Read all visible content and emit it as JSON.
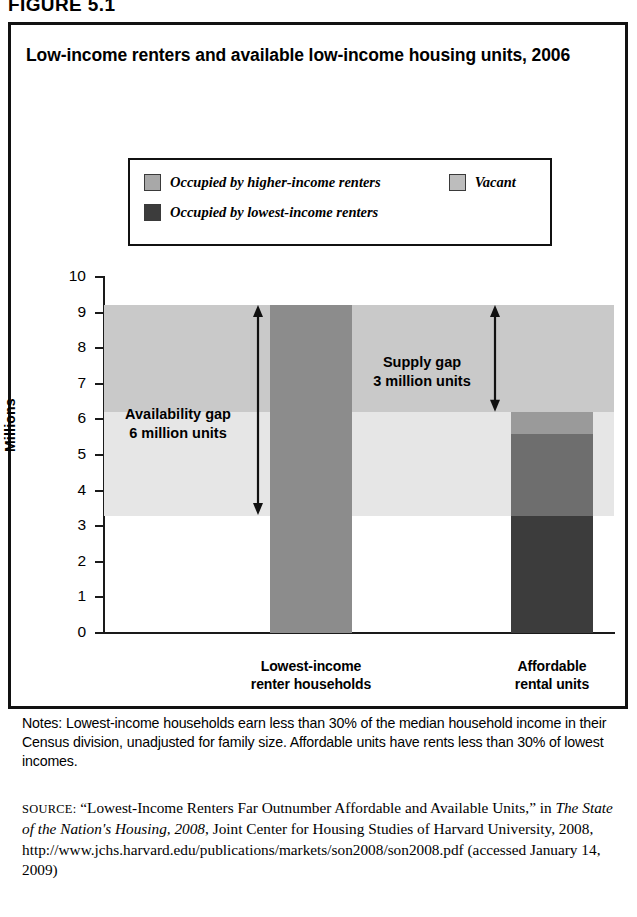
{
  "figure_number": "FIGURE 5.1",
  "title": "Low-income renters and available low-income housing units, 2006",
  "y_axis_title": "Millions",
  "legend": {
    "items": [
      {
        "label": "Occupied by higher-income renters",
        "color": "#a8a8a8",
        "swatch": "legend-swatch-higher-income"
      },
      {
        "label": "Vacant",
        "color": "#bdbdbd",
        "swatch": "legend-swatch-vacant"
      },
      {
        "label": "Occupied by lowest-income renters",
        "color": "#3c3c3c",
        "swatch": "legend-swatch-lowest-income"
      }
    ]
  },
  "annotations": {
    "availability": {
      "line1": "Availability gap",
      "line2": "6 million units",
      "from": 3.3,
      "to": 9.2
    },
    "supply": {
      "line1": "Supply gap",
      "line2": "3 million units",
      "from": 6.2,
      "to": 9.2
    }
  },
  "notes": "Notes: Lowest-income households earn less than 30% of the median household income in their Census division, unadjusted for family size. Affordable units have rents less than 30% of lowest incomes.",
  "source": {
    "prefix": "SOURCE:",
    "part1": " “Lowest-Income Renters Far Outnumber Affordable and Available Units,” in ",
    "italic": "The State of the Nation's Housing, 2008",
    "part2": ", Joint Center for Housing Studies of Harvard University, 2008, http://www.jchs.harvard.edu/publications/markets/son2008/son2008.pdf (accessed January 14, 2009)"
  },
  "chart_data": {
    "type": "bar",
    "title": "Low-income renters and available low-income housing units, 2006",
    "xlabel": "",
    "ylabel": "Millions",
    "ylim": [
      0,
      10
    ],
    "yticks": [
      0,
      1,
      2,
      3,
      4,
      5,
      6,
      7,
      8,
      9,
      10
    ],
    "grid": false,
    "legend_position": "top",
    "categories": [
      "Lowest-income renter households",
      "Affordable rental units"
    ],
    "category_labels": [
      {
        "line1": "Lowest-income",
        "line2": "renter households"
      },
      {
        "line1": "Affordable",
        "line2": "rental units"
      }
    ],
    "series": [
      {
        "name": "Occupied by lowest-income renters",
        "color": "#3c3c3c",
        "values": [
          null,
          3.3
        ]
      },
      {
        "name": "Occupied by higher-income renters",
        "color": "#8c8c8c",
        "values": [
          9.2,
          2.3
        ]
      },
      {
        "name": "Vacant",
        "color": "#a0a0a0",
        "values": [
          null,
          0.6
        ]
      }
    ],
    "bars": [
      {
        "category": "Lowest-income renter households",
        "total": 9.2,
        "segments": [
          {
            "name": "Lowest-income renter households",
            "from": 0,
            "to": 9.2,
            "color": "#8c8c8c"
          }
        ]
      },
      {
        "category": "Affordable rental units",
        "total": 6.2,
        "segments": [
          {
            "name": "Occupied by lowest-income renters",
            "from": 0,
            "to": 3.3,
            "color": "#3c3c3c"
          },
          {
            "name": "Occupied by higher-income renters",
            "from": 3.3,
            "to": 5.6,
            "color": "#6e6e6e"
          },
          {
            "name": "Vacant",
            "from": 5.6,
            "to": 6.2,
            "color": "#9a9a9a"
          }
        ]
      }
    ],
    "background_bands": [
      {
        "name": "availability-band",
        "from": 3.3,
        "to": 9.2,
        "color": "#e6e6e6"
      },
      {
        "name": "supply-band",
        "from": 6.2,
        "to": 9.2,
        "color": "#c9c9c9"
      }
    ],
    "annotations": [
      {
        "name": "availability-gap",
        "text": "Availability gap 6 million units",
        "value": 6
      },
      {
        "name": "supply-gap",
        "text": "Supply gap 3 million units",
        "value": 3
      }
    ]
  }
}
